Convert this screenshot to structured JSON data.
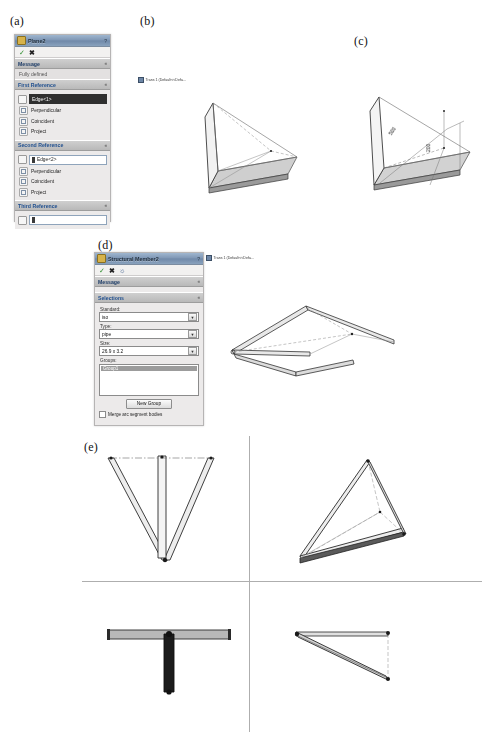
{
  "figure": {
    "panels": [
      {
        "id": "a",
        "label": "(a)"
      },
      {
        "id": "b",
        "label": "(b)"
      },
      {
        "id": "c",
        "label": "(c)"
      },
      {
        "id": "d",
        "label": "(d)"
      },
      {
        "id": "e",
        "label": "(e)"
      }
    ]
  },
  "plane_panel": {
    "title": "Plane2",
    "title_icon": "plane-icon",
    "help_button": "?",
    "accept_icon": "check-icon",
    "cancel_icon": "cross-icon",
    "sections": {
      "message": {
        "header": "Message",
        "caret": "«",
        "text": "Fully defined"
      },
      "first_reference": {
        "header": "First Reference",
        "caret": "«",
        "selection": "Edge<1>",
        "options": [
          "Perpendicular",
          "Coincident",
          "Project"
        ]
      },
      "second_reference": {
        "header": "Second Reference",
        "caret": "«",
        "selection": "Edge<2>",
        "options": [
          "Perpendicular",
          "Coincident",
          "Project"
        ]
      },
      "third_reference": {
        "header": "Third Reference",
        "caret": "«",
        "selection": ""
      }
    }
  },
  "member_panel": {
    "title": "Structural Member2",
    "title_icon": "structural-member-icon",
    "help_button": "?",
    "accept_icon": "check-icon",
    "cancel_icon": "cross-icon",
    "glasses_icon": "preview-icon",
    "sections": {
      "message": {
        "header": "Message",
        "caret": "«"
      },
      "selections": {
        "header": "Selections",
        "caret": "«",
        "standard_label": "Standard:",
        "standard_value": "iso",
        "type_label": "Type:",
        "type_value": "pipe",
        "size_label": "Size:",
        "size_value": "26.9 x 3.2",
        "groups_label": "Groups:",
        "group_item": "Group1",
        "new_group_button": "New Group",
        "merge_checkbox_label": "Merge arc segment bodies"
      }
    }
  },
  "viewport_b": {
    "tree_label": "Trans 1 (Default<<Defa...",
    "icon": "part-icon"
  },
  "viewport_d": {
    "tree_label": "Trans 1 (Default<<Defa...",
    "icon": "part-icon"
  },
  "dimensions_c": {
    "horizontal": "500",
    "vertical": "200"
  },
  "colors": {
    "panel_bg": "#eceaea",
    "section_header": "#cfcfcf",
    "title_bar": "#7e96b4",
    "selection_highlight": "#2f2f2f",
    "accent_text": "#1c3b66",
    "geometry_line": "#3a3a3a",
    "geometry_fill": "#d9d9d9"
  }
}
